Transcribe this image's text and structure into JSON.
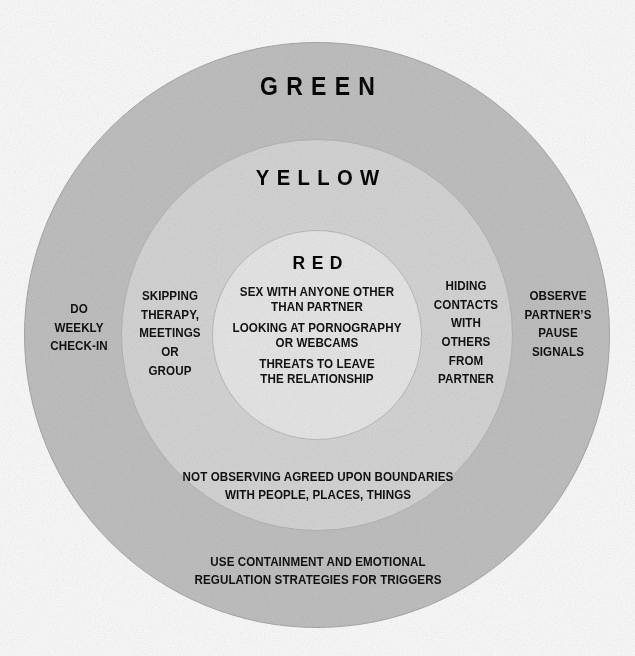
{
  "diagram": {
    "type": "concentric-circles",
    "title_visible": false,
    "zones": [
      {
        "id": "green",
        "label": "GREEN",
        "fill": "#c2c2c2",
        "stroke": "#a9a9a9",
        "items_left": [
          "DO",
          "WEEKLY",
          "CHECK-IN"
        ],
        "items_right": [
          "OBSERVE",
          "PARTNER’S",
          "PAUSE",
          "SIGNALS"
        ],
        "items_bottom": [
          "USE CONTAINMENT AND EMOTIONAL",
          "REGULATION STRATEGIES FOR TRIGGERS"
        ]
      },
      {
        "id": "yellow",
        "label": "YELLOW",
        "fill": "#d7d7d7",
        "stroke": "#b6b6b6",
        "items_left": [
          "SKIPPING",
          "THERAPY,",
          "MEETINGS",
          "OR",
          "GROUP"
        ],
        "items_right": [
          "HIDING",
          "CONTACTS",
          "WITH",
          "OTHERS",
          "FROM",
          "PARTNER"
        ],
        "items_bottom": [
          "NOT OBSERVING AGREED UPON BOUNDARIES",
          "WITH PEOPLE, PLACES, THINGS"
        ]
      },
      {
        "id": "red",
        "label": "RED",
        "fill": "#e9e9e9",
        "stroke": "#bdbdbd",
        "items": [
          [
            "SEX WITH ANYONE OTHER",
            "THAN PARTNER"
          ],
          [
            "LOOKING AT PORNOGRAPHY",
            "OR WEBCAMS"
          ],
          [
            "THREATS TO LEAVE",
            "THE RELATIONSHIP"
          ]
        ]
      }
    ]
  }
}
